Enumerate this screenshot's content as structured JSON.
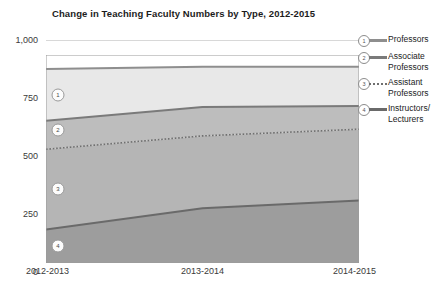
{
  "chart_data": {
    "type": "area",
    "stacked": true,
    "title": "Change in Teaching Faculty Numbers by Type, 2012-2015",
    "xlabel": "",
    "ylabel": "",
    "categories": [
      "2012-2013",
      "2013-2014",
      "2014-2015"
    ],
    "ylim": [
      0,
      1000
    ],
    "yticks": [
      0,
      250,
      500,
      750,
      1000
    ],
    "ytick_labels": [
      "0",
      "250",
      "500",
      "750",
      "1,000"
    ],
    "grid": true,
    "legend_position": "right",
    "series": [
      {
        "name": "Professors",
        "legend_number": "1",
        "values": [
          232,
          180,
          176
        ],
        "cumulative_top": [
          870,
          880,
          880
        ],
        "color": "#e8e8e8",
        "line_color": "#8e8e8e",
        "line_style": "solid"
      },
      {
        "name": "Associate Professors",
        "legend_number": "2",
        "values": [
          128,
          130,
          104
        ],
        "cumulative_top": [
          638,
          700,
          704
        ],
        "color": "#bdbdbd",
        "line_color": "#7a7a7a",
        "line_style": "solid"
      },
      {
        "name": "Assistant Professors",
        "legend_number": "3",
        "values": [
          360,
          325,
          320
        ],
        "cumulative_top": [
          510,
          570,
          600
        ],
        "color": "#b5b5b5",
        "line_color": "#6f6f6f",
        "line_style": "dotted"
      },
      {
        "name": "Instructors/ Lecturers",
        "legend_number": "4",
        "values": [
          150,
          245,
          280
        ],
        "cumulative_top": [
          150,
          245,
          280
        ],
        "color": "#9d9d9d",
        "line_color": "#6a6a6a",
        "line_style": "solid"
      }
    ]
  },
  "legend": {
    "items": [
      {
        "number": "1",
        "label": "Professors"
      },
      {
        "number": "2",
        "label": "Associate\nProfessors"
      },
      {
        "number": "3",
        "label": "Assistant\nProfessors"
      },
      {
        "number": "4",
        "label": "Instructors/\nLecturers"
      }
    ]
  },
  "axes": {
    "y_labels": [
      "1,000",
      "750",
      "500",
      "250",
      "0"
    ],
    "x_labels": [
      "2012-2013",
      "2013-2014",
      "2014-2015"
    ]
  }
}
